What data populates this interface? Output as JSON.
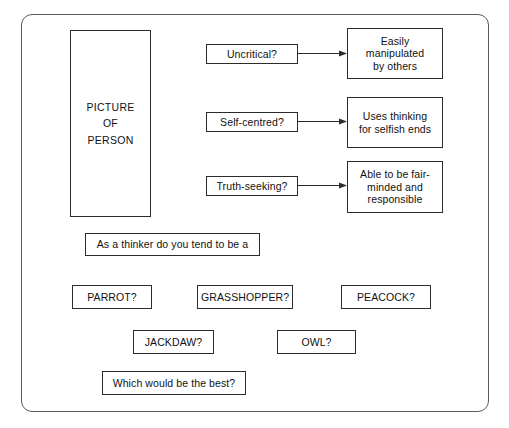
{
  "diagram": {
    "frame": {
      "style": "rounded-rectangle-border"
    },
    "picture_panel": {
      "lines": [
        "PICTURE",
        "OF",
        "PERSON"
      ]
    },
    "rows": [
      {
        "question": "Uncritical?",
        "outcome_lines": [
          "Easily",
          "manipulated",
          "by others"
        ],
        "connector": "arrow-right"
      },
      {
        "question": "Self-centred?",
        "outcome_lines": [
          "Uses thinking",
          "for selfish ends"
        ],
        "connector": "arrow-right"
      },
      {
        "question": "Truth-seeking?",
        "outcome_lines": [
          "Able to be fair-",
          "minded and",
          "responsible"
        ],
        "connector": "arrow-right"
      }
    ],
    "prompt": "As a thinker do you tend to be a",
    "answers": [
      "PARROT?",
      "GRASSHOPPER?",
      "PEACOCK?",
      "JACKDAW?",
      "OWL?"
    ],
    "closing_question": "Which would be the best?",
    "colors": {
      "background": "#ffffff",
      "box_border": "#2b2b2b",
      "frame_border": "#5b5b5b",
      "text": "#111111",
      "arrow": "#2b2b2b"
    }
  }
}
